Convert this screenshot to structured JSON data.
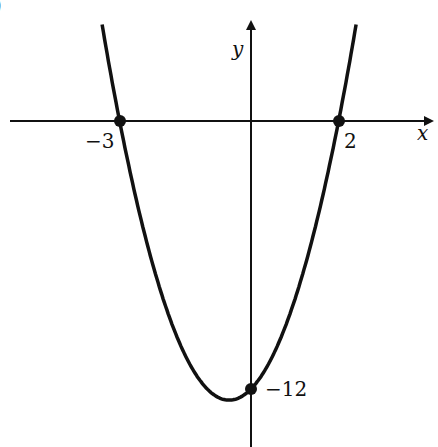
{
  "chart_data": {
    "type": "line",
    "title": "",
    "xlabel": "x",
    "ylabel": "y",
    "function": "y = 2(x + 3)(x - 2)",
    "marked_points": [
      {
        "x": -3,
        "y": 0,
        "label": "−3"
      },
      {
        "x": 2,
        "y": 0,
        "label": "2"
      },
      {
        "x": 0,
        "y": -12,
        "label": "−12"
      }
    ],
    "grid": false,
    "legend": null
  },
  "labels": {
    "x_axis": "x",
    "y_axis": "y",
    "root_left": "−3",
    "root_right": "2",
    "y_intercept": "−12",
    "corner": ")"
  }
}
